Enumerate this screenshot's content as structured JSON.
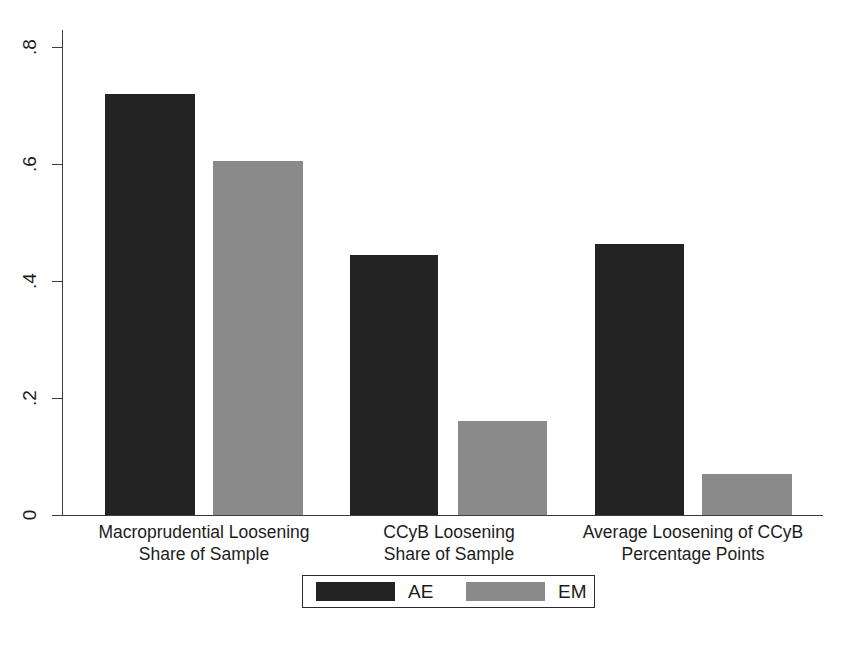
{
  "chart_data": {
    "type": "bar",
    "title": "",
    "subtitle": "",
    "xlabel": "",
    "ylabel": "",
    "grid": false,
    "legend_position": "bottom",
    "ylim": [
      0,
      0.8
    ],
    "yticks": [
      "0",
      ".2",
      ".4",
      ".6",
      ".8"
    ],
    "ytick_values": [
      0,
      0.2,
      0.4,
      0.6,
      0.8
    ],
    "categories": [
      "Macroprudential Loosening\nShare of Sample",
      "CCyB Loosening\nShare of Sample",
      "Average Loosening of CCyB\nPercentage Points"
    ],
    "category_lines": [
      {
        "line1": "Macroprudential Loosening",
        "line2": "Share of Sample"
      },
      {
        "line1": "CCyB Loosening",
        "line2": "Share of Sample"
      },
      {
        "line1": "Average Loosening of CCyB",
        "line2": "Percentage Points"
      }
    ],
    "series": [
      {
        "name": "AE",
        "color": "#232323",
        "values": [
          0.72,
          0.445,
          0.463
        ]
      },
      {
        "name": "EM",
        "color": "#8a8a8a",
        "values": [
          0.605,
          0.16,
          0.07
        ]
      }
    ]
  },
  "legend": {
    "entries": [
      {
        "label": "AE",
        "color": "#232323"
      },
      {
        "label": "EM",
        "color": "#8a8a8a"
      }
    ]
  },
  "axis": {
    "y_tick_labels": [
      ".8",
      ".6",
      ".4",
      ".2",
      "0"
    ]
  },
  "colors": {
    "ae": "#232323",
    "em": "#8a8a8a",
    "axis": "#3b3b3b",
    "text": "#1c1c1c",
    "background": "#ffffff"
  }
}
